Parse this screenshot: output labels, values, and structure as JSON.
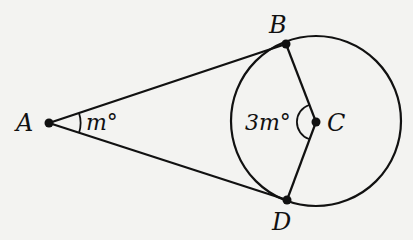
{
  "diagram": {
    "type": "geometry",
    "points": {
      "A": {
        "label": "A",
        "x": 49,
        "y": 123
      },
      "B": {
        "label": "B",
        "x": 286,
        "y": 44
      },
      "C": {
        "label": "C",
        "x": 316,
        "y": 122
      },
      "D": {
        "label": "D",
        "x": 287,
        "y": 200
      }
    },
    "circle": {
      "center": "C",
      "cx": 316,
      "cy": 121,
      "r": 85
    },
    "segments": [
      [
        "A",
        "B"
      ],
      [
        "A",
        "D"
      ],
      [
        "B",
        "C"
      ],
      [
        "C",
        "D"
      ]
    ],
    "angles": {
      "A": {
        "label": "m°",
        "vertex": "A"
      },
      "C": {
        "label": "3m°",
        "vertex": "C"
      }
    },
    "colors": {
      "stroke": "#111111",
      "background": "#f3f3f1"
    }
  }
}
